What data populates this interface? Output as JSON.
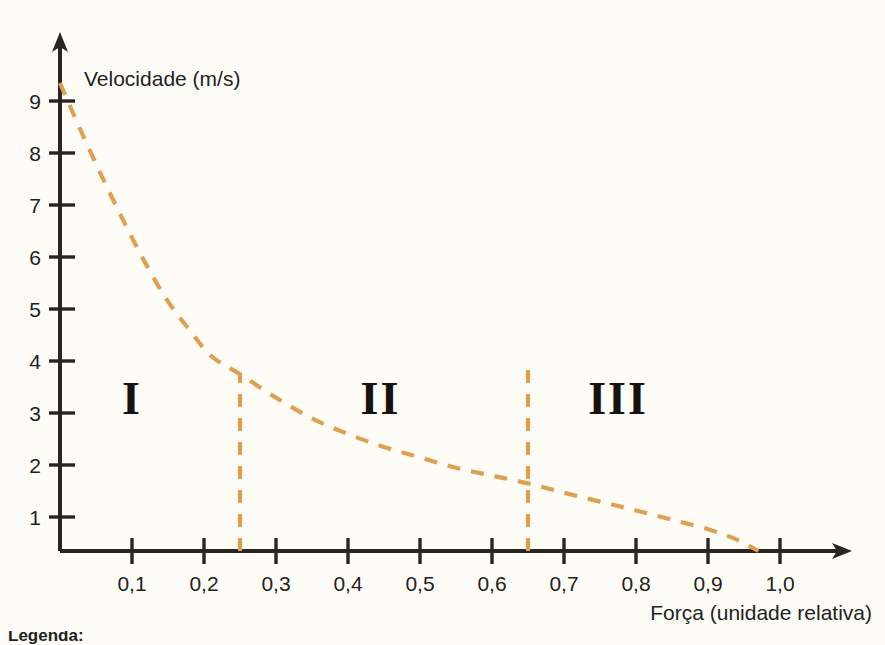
{
  "chart_data": {
    "type": "line",
    "title": "",
    "subtitle": "",
    "xlabel": "Força (unidade relativa)",
    "ylabel": "Velocidade (m/s)",
    "xlim": [
      0,
      1.05
    ],
    "ylim": [
      0,
      9.6
    ],
    "grid": false,
    "legend_position": "none",
    "x_ticks": [
      {
        "value": 0.1,
        "label": "0,1"
      },
      {
        "value": 0.2,
        "label": "0,2"
      },
      {
        "value": 0.3,
        "label": "0,3"
      },
      {
        "value": 0.4,
        "label": "0,4"
      },
      {
        "value": 0.5,
        "label": "0,5"
      },
      {
        "value": 0.6,
        "label": "0,6"
      },
      {
        "value": 0.7,
        "label": "0,7"
      },
      {
        "value": 0.8,
        "label": "0,8"
      },
      {
        "value": 0.9,
        "label": "0,9"
      },
      {
        "value": 1.0,
        "label": "1,0"
      }
    ],
    "y_ticks": [
      {
        "value": 1,
        "label": "1"
      },
      {
        "value": 2,
        "label": "2"
      },
      {
        "value": 3,
        "label": "3"
      },
      {
        "value": 4,
        "label": "4"
      },
      {
        "value": 5,
        "label": "5"
      },
      {
        "value": 6,
        "label": "6"
      },
      {
        "value": 7,
        "label": "7"
      },
      {
        "value": 8,
        "label": "8"
      },
      {
        "value": 9,
        "label": "9"
      }
    ],
    "series": [
      {
        "name": "velocidade-vs-forca",
        "style": "dashed",
        "color": "#e0a051",
        "x": [
          0.0,
          0.03,
          0.06,
          0.09,
          0.12,
          0.15,
          0.18,
          0.21,
          0.25,
          0.3,
          0.35,
          0.4,
          0.45,
          0.5,
          0.55,
          0.6,
          0.65,
          0.7,
          0.75,
          0.8,
          0.85,
          0.9,
          0.94,
          0.97
        ],
        "y": [
          9.0,
          8.05,
          7.15,
          6.3,
          5.5,
          4.8,
          4.25,
          3.75,
          3.4,
          2.95,
          2.55,
          2.25,
          2.0,
          1.8,
          1.6,
          1.45,
          1.3,
          1.12,
          0.95,
          0.78,
          0.6,
          0.42,
          0.22,
          0.0
        ]
      }
    ],
    "annotations": [
      {
        "type": "region-label",
        "text": "I",
        "x": 0.1,
        "y": 2.95
      },
      {
        "type": "region-label",
        "text": "II",
        "x": 0.445,
        "y": 2.95
      },
      {
        "type": "region-label",
        "text": "III",
        "x": 0.775,
        "y": 2.95
      },
      {
        "type": "vertical-divider",
        "x": 0.25,
        "y_from": 0,
        "y_to": 3.42,
        "color": "#e0a051"
      },
      {
        "type": "vertical-divider",
        "x": 0.65,
        "y_from": 0,
        "y_to": 3.5,
        "color": "#e0a051"
      }
    ]
  },
  "axes": {
    "y_axis_label": "Velocidade (m/s)",
    "x_axis_label": "Força (unidade relativa)"
  },
  "regions": [
    {
      "id": "region-1",
      "label": "I"
    },
    {
      "id": "region-2",
      "label": "II"
    },
    {
      "id": "region-3",
      "label": "III"
    }
  ],
  "x_tick_labels": [
    "0,1",
    "0,2",
    "0,3",
    "0,4",
    "0,5",
    "0,6",
    "0,7",
    "0,8",
    "0,9",
    "1,0"
  ],
  "y_tick_labels": [
    "1",
    "2",
    "3",
    "4",
    "5",
    "6",
    "7",
    "8",
    "9"
  ],
  "footer": {
    "legend_heading": "Legenda:"
  },
  "colors": {
    "curve": "#e0a051",
    "axis": "#2b2522",
    "text": "#231f1c",
    "background": "#fdfcf7"
  }
}
